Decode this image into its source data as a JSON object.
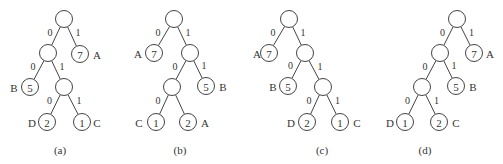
{
  "figure": {
    "node_radius": 8.5,
    "stroke_color": "#444444",
    "background": "#ffffff"
  },
  "trees": [
    {
      "id": "a",
      "caption": "(a)",
      "caption_pos": [
        60,
        150
      ],
      "nodes": [
        {
          "id": "r",
          "x": 64,
          "y": 19,
          "weight": ""
        },
        {
          "id": "n1",
          "x": 48,
          "y": 53,
          "weight": ""
        },
        {
          "id": "l7",
          "x": 80,
          "y": 54,
          "weight": "7",
          "label": "A",
          "label_x": 97
        },
        {
          "id": "l5",
          "x": 30,
          "y": 87,
          "weight": "5",
          "label": "B",
          "label_x": 14
        },
        {
          "id": "n2",
          "x": 64,
          "y": 87,
          "weight": ""
        },
        {
          "id": "l2",
          "x": 47,
          "y": 122,
          "weight": "2",
          "label": "D",
          "label_x": 32
        },
        {
          "id": "l1",
          "x": 82,
          "y": 122,
          "weight": "1",
          "label": "C",
          "label_x": 97
        }
      ],
      "edges": [
        {
          "from": "r",
          "to": "n1",
          "bit": "0"
        },
        {
          "from": "r",
          "to": "l7",
          "bit": "1"
        },
        {
          "from": "n1",
          "to": "l5",
          "bit": "0"
        },
        {
          "from": "n1",
          "to": "n2",
          "bit": "1"
        },
        {
          "from": "n2",
          "to": "l2",
          "bit": "0"
        },
        {
          "from": "n2",
          "to": "l1",
          "bit": "1"
        }
      ]
    },
    {
      "id": "b",
      "caption": "(b)",
      "caption_pos": [
        180,
        150
      ],
      "nodes": [
        {
          "id": "r",
          "x": 174,
          "y": 19,
          "weight": ""
        },
        {
          "id": "l7",
          "x": 154,
          "y": 53,
          "weight": "7",
          "label": "A",
          "label_x": 138
        },
        {
          "id": "n1",
          "x": 190,
          "y": 53,
          "weight": ""
        },
        {
          "id": "n2",
          "x": 172,
          "y": 87,
          "weight": ""
        },
        {
          "id": "l5",
          "x": 206,
          "y": 86,
          "weight": "5",
          "label": "B",
          "label_x": 223
        },
        {
          "id": "l1",
          "x": 156,
          "y": 122,
          "weight": "1",
          "label": "C",
          "label_x": 139
        },
        {
          "id": "l2",
          "x": 188,
          "y": 122,
          "weight": "2",
          "label": "A",
          "label_x": 205
        }
      ],
      "edges": [
        {
          "from": "r",
          "to": "l7",
          "bit": "0"
        },
        {
          "from": "r",
          "to": "n1",
          "bit": "1"
        },
        {
          "from": "n1",
          "to": "n2",
          "bit": "0"
        },
        {
          "from": "n1",
          "to": "l5",
          "bit": "1"
        },
        {
          "from": "n2",
          "to": "l1",
          "bit": "0"
        },
        {
          "from": "n2",
          "to": "l2",
          "bit": ""
        }
      ]
    },
    {
      "id": "c",
      "caption": "(c)",
      "caption_pos": [
        322,
        150
      ],
      "nodes": [
        {
          "id": "r",
          "x": 289,
          "y": 19,
          "weight": ""
        },
        {
          "id": "l7",
          "x": 269,
          "y": 53,
          "weight": "7",
          "label": "A",
          "label_x": 257
        },
        {
          "id": "n1",
          "x": 305,
          "y": 53,
          "weight": ""
        },
        {
          "id": "l5",
          "x": 288,
          "y": 86,
          "weight": "5",
          "label": "B",
          "label_x": 273
        },
        {
          "id": "n2",
          "x": 323,
          "y": 87,
          "weight": ""
        },
        {
          "id": "l2",
          "x": 307,
          "y": 122,
          "weight": "2",
          "label": "D",
          "label_x": 291
        },
        {
          "id": "l1",
          "x": 340,
          "y": 122,
          "weight": "1",
          "label": "C",
          "label_x": 357
        }
      ],
      "edges": [
        {
          "from": "r",
          "to": "l7",
          "bit": "0"
        },
        {
          "from": "r",
          "to": "n1",
          "bit": "1"
        },
        {
          "from": "n1",
          "to": "l5",
          "bit": "0"
        },
        {
          "from": "n1",
          "to": "n2",
          "bit": "1"
        },
        {
          "from": "n2",
          "to": "l2",
          "bit": "0"
        },
        {
          "from": "n2",
          "to": "l1",
          "bit": "1"
        }
      ]
    },
    {
      "id": "d",
      "caption": "(d)",
      "caption_pos": [
        425,
        150
      ],
      "nodes": [
        {
          "id": "r",
          "x": 457,
          "y": 19,
          "weight": ""
        },
        {
          "id": "n1",
          "x": 440,
          "y": 53,
          "weight": ""
        },
        {
          "id": "l7",
          "x": 474,
          "y": 53,
          "weight": "7",
          "label": "A",
          "label_x": 490
        },
        {
          "id": "n2",
          "x": 422,
          "y": 87,
          "weight": ""
        },
        {
          "id": "l5",
          "x": 456,
          "y": 86,
          "weight": "5",
          "label": "B",
          "label_x": 473
        },
        {
          "id": "l1",
          "x": 405,
          "y": 122,
          "weight": "1",
          "label": "D",
          "label_x": 390
        },
        {
          "id": "l2",
          "x": 439,
          "y": 122,
          "weight": "2",
          "label": "C",
          "label_x": 456
        }
      ],
      "edges": [
        {
          "from": "r",
          "to": "n1",
          "bit": "0"
        },
        {
          "from": "r",
          "to": "l7",
          "bit": "1"
        },
        {
          "from": "n1",
          "to": "n2",
          "bit": "0"
        },
        {
          "from": "n1",
          "to": "l5",
          "bit": "1"
        },
        {
          "from": "n2",
          "to": "l1",
          "bit": "0"
        },
        {
          "from": "n2",
          "to": "l2",
          "bit": "1"
        }
      ]
    }
  ]
}
